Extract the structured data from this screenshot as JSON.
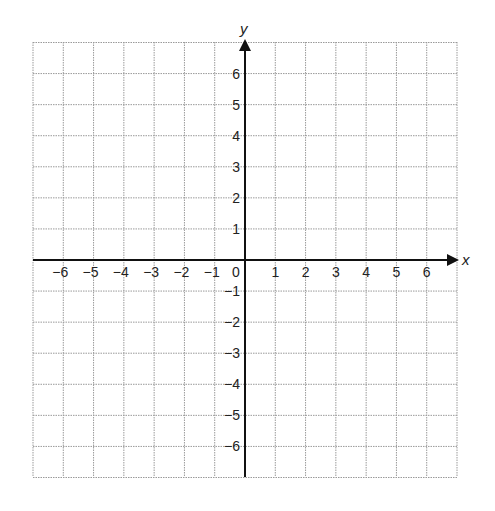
{
  "chart_data": {
    "type": "scatter",
    "title": "",
    "xlabel": "x",
    "ylabel": "y",
    "xlim": [
      -7,
      7
    ],
    "ylim": [
      -7,
      7
    ],
    "grid": true,
    "x_ticks": [
      -6,
      -5,
      -4,
      -3,
      -2,
      -1,
      0,
      1,
      2,
      3,
      4,
      5,
      6
    ],
    "y_ticks": [
      -6,
      -5,
      -4,
      -3,
      -2,
      -1,
      1,
      2,
      3,
      4,
      5,
      6
    ],
    "x_tick_labels": [
      "−6",
      "−5",
      "−4",
      "−3",
      "−2",
      "−1",
      "0",
      "1",
      "2",
      "3",
      "4",
      "5",
      "6"
    ],
    "y_tick_labels": [
      "−6",
      "−5",
      "−4",
      "−3",
      "−2",
      "−1",
      "1",
      "2",
      "3",
      "4",
      "5",
      "6"
    ],
    "series": [],
    "colors": {
      "grid": "#9a9a9a",
      "axis": "#111111"
    }
  },
  "labels": {
    "x_axis": "x",
    "y_axis": "y",
    "origin": "0"
  }
}
